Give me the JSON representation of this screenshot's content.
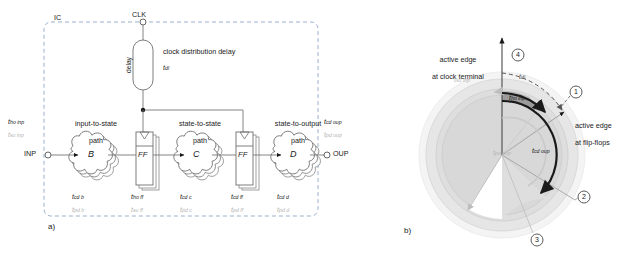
{
  "figure": {
    "panel_a_tag": "a)",
    "panel_b_tag": "b)"
  },
  "panel_a": {
    "chip_label": "IC",
    "clk_terminal": "CLK",
    "inp_terminal": "INP",
    "oup_terminal": "OUP",
    "delay_block_label": "delay",
    "delay_caption": "clock distribution delay",
    "delay_symbol_base": "t",
    "delay_symbol_sub": "dl",
    "paths": [
      {
        "name": "input-to-state",
        "line1": "input-to-state",
        "line2": "path"
      },
      {
        "name": "state-to-state",
        "line1": "state-to-state",
        "line2": "path"
      },
      {
        "name": "state-to-output",
        "line1": "state-to-output",
        "line2": "path"
      }
    ],
    "blocks": [
      {
        "id": "B",
        "label": "B",
        "type": "cloud"
      },
      {
        "id": "FF1",
        "label": "FF",
        "type": "flipflop"
      },
      {
        "id": "C",
        "label": "C",
        "type": "cloud"
      },
      {
        "id": "FF2",
        "label": "FF",
        "type": "flipflop"
      },
      {
        "id": "D",
        "label": "D",
        "type": "cloud"
      }
    ],
    "input_timing": {
      "top_base": "t",
      "top_sub": "ho inp",
      "bot_base": "t",
      "bot_sub": "su inp"
    },
    "output_timing": {
      "top_base": "t",
      "top_sub": "cd oup",
      "bot_base": "t",
      "bot_sub": "pd oup"
    },
    "block_timing": [
      {
        "top_base": "t",
        "top_sub": "cd b",
        "bot_base": "t",
        "bot_sub": "pd b"
      },
      {
        "top_base": "t",
        "top_sub": "ho ff",
        "bot_base": "t",
        "bot_sub": "su ff"
      },
      {
        "top_base": "t",
        "top_sub": "cd c",
        "bot_base": "t",
        "bot_sub": "pd c"
      },
      {
        "top_base": "t",
        "top_sub": "cd ff",
        "bot_base": "t",
        "bot_sub": "pd ff"
      },
      {
        "top_base": "t",
        "top_sub": "cd d",
        "bot_base": "t",
        "bot_sub": "pd d"
      }
    ]
  },
  "panel_b": {
    "axis_label_top_line1": "active edge",
    "axis_label_top_line2": "at clock terminal",
    "axis_label_right_line1": "active edge",
    "axis_label_right_line2": "at flip-flops",
    "callouts": [
      "1",
      "2",
      "3",
      "4"
    ],
    "arcs": [
      {
        "name": "t_dl",
        "base": "t",
        "sub": "dl",
        "style": "dashed-gray",
        "color": "#555555"
      },
      {
        "name": "t_su_inp",
        "base": "t",
        "sub": "su inp",
        "style": "gray",
        "color": "#b5b5b5"
      },
      {
        "name": "t_ho_inp",
        "base": "t",
        "sub": "ho inp",
        "style": "solid-black",
        "color": "#1a1a1a"
      },
      {
        "name": "t_pd_oup",
        "base": "t",
        "sub": "pd oup",
        "style": "gray",
        "color": "#b5b5b5"
      },
      {
        "name": "t_cd_oup",
        "base": "t",
        "sub": "cd oup",
        "style": "solid-black",
        "color": "#1a1a1a"
      }
    ]
  },
  "colors": {
    "ink": "#1a1a1a",
    "gray_text": "#b5b5b5",
    "disc_light": "#e9e9e9",
    "disc_mid": "#dcdcdc",
    "disc_dark": "#c9c9c9",
    "band_dark": "#8e8e8e",
    "dashed": "#555555"
  }
}
